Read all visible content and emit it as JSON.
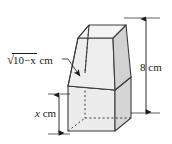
{
  "figure": {
    "kind": "solid-geometry-diagram",
    "labels": {
      "total_height": {
        "text": "8 cm",
        "value": 8,
        "unit": "cm",
        "position": "right"
      },
      "base_height": {
        "text": "x cm",
        "variable": "x",
        "unit": "cm",
        "position": "left-bottom"
      },
      "mid_edge": {
        "radicand": "10−x",
        "unit": "cm",
        "radical_glyph": "√",
        "full_text": "√10−x cm",
        "position": "left-middle"
      }
    },
    "colors": {
      "outline": "#3c3c3c",
      "hidden_edge": "#3c3c3c",
      "face_light": "#f0f0f0",
      "face_mid": "#e0e0e0",
      "face_dark": "#c6c6c6",
      "face_shaded": "#b4b4b4",
      "background": "#ffffff",
      "dimension_line": "#1a1a1a"
    },
    "dimension_lines": [
      {
        "name": "total-height-dimension",
        "orientation": "vertical",
        "arrows": "both"
      },
      {
        "name": "base-height-dimension",
        "orientation": "vertical",
        "arrows": "both"
      }
    ],
    "leader": {
      "name": "mid-edge-leader",
      "arrow": "end"
    }
  }
}
